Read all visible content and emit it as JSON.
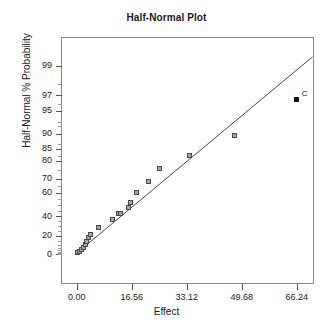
{
  "chart_data": {
    "type": "scatter",
    "title": "Half-Normal Plot",
    "xlabel": "Effect",
    "ylabel": "Half-Normal % Probability",
    "grid": false,
    "legend": "none",
    "xlim": [
      -5.5,
      71.0
    ],
    "ylim": [
      0,
      99
    ],
    "x_ticks": [
      "0.00",
      "16.56",
      "33.12",
      "49.68",
      "66.24"
    ],
    "x_tick_values": [
      0.0,
      16.56,
      33.12,
      49.68,
      66.24
    ],
    "y_ticks": [
      "0",
      "20",
      "40",
      "60",
      "70",
      "80",
      "85",
      "90",
      "95",
      "97",
      "99"
    ],
    "y_tick_values": [
      0,
      20,
      40,
      60,
      70,
      80,
      85,
      90,
      95,
      97,
      99
    ],
    "series": [
      {
        "name": "Effects",
        "marker": "open-square",
        "color": "#a6a6a6",
        "points": [
          {
            "x": 0.3,
            "y": 2.0,
            "label": ""
          },
          {
            "x": 0.75,
            "y": 3.2,
            "label": ""
          },
          {
            "x": 1.3,
            "y": 5.0,
            "label": ""
          },
          {
            "x": 1.95,
            "y": 7.5,
            "label": ""
          },
          {
            "x": 2.6,
            "y": 10.5,
            "label": ""
          },
          {
            "x": 3.1,
            "y": 14.5,
            "label": ""
          },
          {
            "x": 3.55,
            "y": 18.0,
            "label": ""
          },
          {
            "x": 4.15,
            "y": 21.5,
            "label": ""
          },
          {
            "x": 6.55,
            "y": 29.0,
            "label": ""
          },
          {
            "x": 10.75,
            "y": 37.0,
            "label": ""
          },
          {
            "x": 12.7,
            "y": 42.0,
            "label": ""
          },
          {
            "x": 13.2,
            "y": 42.5,
            "label": ""
          },
          {
            "x": 15.6,
            "y": 47.5,
            "label": ""
          },
          {
            "x": 16.1,
            "y": 52.0,
            "label": ""
          },
          {
            "x": 18.0,
            "y": 60.0,
            "label": ""
          },
          {
            "x": 21.7,
            "y": 68.0,
            "label": ""
          },
          {
            "x": 25.0,
            "y": 76.0,
            "label": ""
          },
          {
            "x": 34.0,
            "y": 82.5,
            "label": ""
          },
          {
            "x": 47.5,
            "y": 89.5,
            "label": ""
          }
        ]
      },
      {
        "name": "Significant effect",
        "marker": "filled-square",
        "color": "#111111",
        "points": [
          {
            "x": 66.24,
            "y": 96.5,
            "label": "C"
          }
        ]
      }
    ],
    "fit_line": {
      "name": "half-normal reference line",
      "x_start": 0.0,
      "y_start": 1.5,
      "x_end": 71.0,
      "y_end": 99.3
    }
  }
}
